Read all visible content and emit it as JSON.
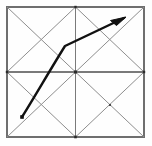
{
  "figure": {
    "background_color": "#fefefe",
    "canvas": {
      "width": 152,
      "height": 146
    },
    "square": {
      "name": "outer-square",
      "left": 7,
      "top": 7,
      "right": 144,
      "bottom": 137,
      "stroke_color": "#6f6f6f"
    },
    "grid": {
      "divisions": 2,
      "midpoint_x": 75.5,
      "midpoint_y": 72,
      "line_color": "#7a7a7a",
      "diagonal_color": "#8e8e8e",
      "description": "square split into 2x2 quadrants, each quadrant crossed by both diagonals forming an X"
    },
    "nodes": [
      {
        "name": "node-top-mid",
        "x": 75.5,
        "y": 7,
        "size": 2.4
      },
      {
        "name": "node-left-mid",
        "x": 7,
        "y": 72,
        "size": 2.4
      },
      {
        "name": "node-center",
        "x": 75.5,
        "y": 72,
        "size": 3.0
      },
      {
        "name": "node-right-mid",
        "x": 144,
        "y": 72,
        "size": 2.4
      },
      {
        "name": "node-bottom-mid",
        "x": 75.5,
        "y": 137,
        "size": 2.6
      },
      {
        "name": "node-quadrant-br-center",
        "x": 110,
        "y": 105,
        "size": 2.0
      }
    ],
    "arrow": {
      "name": "curved-arrow",
      "color": "#111111",
      "tail": {
        "x": 22,
        "y": 117
      },
      "bend": {
        "x": 65,
        "y": 46
      },
      "tip": {
        "x": 126,
        "y": 17
      },
      "path": "M 22 117 C 34 98, 50 70, 65 46 L 124 18",
      "head_points": "126,17 111,21 116,25",
      "direction": "up-and-to-the-right",
      "tail_marker": "filled-square-dot"
    }
  }
}
